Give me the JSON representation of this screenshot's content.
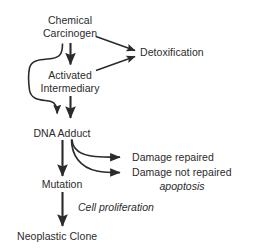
{
  "diagram": {
    "background_color": "#ffffff",
    "stroke_color": "#2b2b2b",
    "text_color": "#2b2b2b",
    "nodes": [
      {
        "id": "chemical_carcinogen",
        "lines": [
          "Chemical",
          "Carcinogen"
        ]
      },
      {
        "id": "activated_intermediary",
        "lines": [
          "Activated",
          "Intermediary"
        ]
      },
      {
        "id": "dna_adduct",
        "lines": [
          "DNA Adduct"
        ]
      },
      {
        "id": "mutation",
        "lines": [
          "Mutation"
        ]
      },
      {
        "id": "neoplastic_clone",
        "lines": [
          "Neoplastic Clone"
        ]
      },
      {
        "id": "detoxification",
        "lines": [
          "Detoxification"
        ]
      },
      {
        "id": "damage_repaired",
        "lines": [
          "Damage repaired"
        ]
      },
      {
        "id": "damage_not_repaired",
        "lines": [
          "Damage not repaired"
        ]
      }
    ],
    "annotations": [
      {
        "id": "apoptosis",
        "text": "apoptosis",
        "style": "italic"
      },
      {
        "id": "cell_proliferation",
        "text": "Cell proliferation",
        "style": "italic"
      }
    ],
    "edges": [
      {
        "id": "carcinogen-to-intermediary",
        "from": "chemical_carcinogen",
        "to": "activated_intermediary",
        "shape": "straight"
      },
      {
        "id": "carcinogen-to-detoxification",
        "from": "chemical_carcinogen",
        "to": "detoxification",
        "shape": "diagonal"
      },
      {
        "id": "intermediary-to-detoxification",
        "from": "activated_intermediary",
        "to": "detoxification",
        "shape": "diagonal"
      },
      {
        "id": "carcinogen-bypass-to-dna-adduct",
        "from": "chemical_carcinogen",
        "to": "dna_adduct",
        "shape": "curved-bypass"
      },
      {
        "id": "intermediary-to-dna-adduct",
        "from": "activated_intermediary",
        "to": "dna_adduct",
        "shape": "straight"
      },
      {
        "id": "dna-adduct-to-mutation",
        "from": "dna_adduct",
        "to": "mutation",
        "shape": "straight"
      },
      {
        "id": "dna-adduct-to-damage-repaired",
        "from": "dna_adduct",
        "to": "damage_repaired",
        "shape": "curved"
      },
      {
        "id": "dna-adduct-to-damage-not-repaired",
        "from": "dna_adduct",
        "to": "damage_not_repaired",
        "shape": "curved"
      },
      {
        "id": "mutation-to-neoplastic-clone",
        "from": "mutation",
        "to": "neoplastic_clone",
        "shape": "straight"
      }
    ]
  },
  "labels": {
    "chemical_line1": "Chemical",
    "chemical_line2": "Carcinogen",
    "activated_line1": "Activated",
    "activated_line2": "Intermediary",
    "dna_adduct": "DNA Adduct",
    "mutation": "Mutation",
    "neoplastic_clone": "Neoplastic Clone",
    "detoxification": "Detoxification",
    "damage_repaired": "Damage repaired",
    "damage_not_repaired": "Damage not repaired",
    "apoptosis": "apoptosis",
    "cell_proliferation": "Cell proliferation"
  }
}
